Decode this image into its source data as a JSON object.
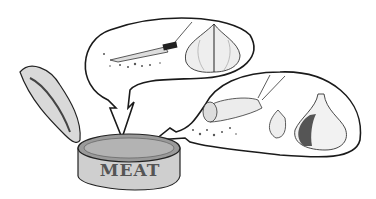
{
  "illustration": {
    "description": "Open tin can labeled MEAT with two thought bubbles: one showing a knife chopping an onion, the other showing a rolling pin crushing spices next to garlic",
    "can": {
      "label": "MEAT"
    },
    "bubble_top": {
      "items": [
        "knife-icon",
        "onion-icon",
        "chopped-herbs"
      ]
    },
    "bubble_right": {
      "items": [
        "rolling-pin-icon",
        "garlic-clove-icon",
        "garlic-bulb-icon",
        "crushed-spices"
      ]
    },
    "colors": {
      "line": "#1a1a1a",
      "shade": "#8a8a8a",
      "dark": "#555555",
      "background": "#ffffff"
    }
  }
}
